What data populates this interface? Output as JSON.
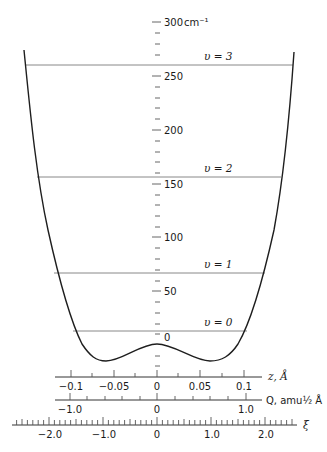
{
  "figure": {
    "energy_axis": {
      "unit_label": "cm⁻¹",
      "ticks": [
        {
          "value": 300,
          "label": "300",
          "y": 22
        },
        {
          "value": 250,
          "label": "250",
          "y": 76
        },
        {
          "value": 200,
          "label": "200",
          "y": 130
        },
        {
          "value": 150,
          "label": "150",
          "y": 184
        },
        {
          "value": 100,
          "label": "100",
          "y": 237
        },
        {
          "value": 50,
          "label": "50",
          "y": 291
        },
        {
          "value": 0,
          "label": "0",
          "y": 345
        }
      ],
      "minor_step": 10,
      "range": [
        -20,
        300
      ]
    },
    "levels": [
      {
        "label": "υ = 3",
        "energy": 260,
        "y": 65,
        "x1": 26,
        "x2": 293
      },
      {
        "label": "υ = 2",
        "energy": 156,
        "y": 177,
        "x1": 37,
        "x2": 281
      },
      {
        "label": "υ = 1",
        "energy": 67,
        "y": 273,
        "x1": 54,
        "x2": 265
      },
      {
        "label": "υ = 0",
        "energy": 13,
        "y": 331,
        "x1": 73,
        "x2": 247
      }
    ],
    "potential": {
      "barrier_energy": 0,
      "minimum_energy": -14,
      "minima_z": [
        -0.063,
        0.063
      ]
    },
    "x_axes": [
      {
        "name": "z",
        "label": "z, Å",
        "ticks": [
          {
            "value": -0.1,
            "label": "−0.1",
            "x": 71
          },
          {
            "value": -0.05,
            "label": "−0.05",
            "x": 114
          },
          {
            "value": 0,
            "label": "0",
            "x": 157
          },
          {
            "value": 0.05,
            "label": "0.05",
            "x": 200
          },
          {
            "value": 0.1,
            "label": "0.1",
            "x": 244
          }
        ]
      },
      {
        "name": "Q",
        "label": "Q, amu½ Å",
        "ticks": [
          {
            "value": -1.0,
            "label": "−1.0",
            "x": 70
          },
          {
            "value": 0,
            "label": "0",
            "x": 157
          },
          {
            "value": 1.0,
            "label": "1.0",
            "x": 246
          }
        ]
      },
      {
        "name": "xi",
        "label": "ξ",
        "ticks": [
          {
            "value": -2.0,
            "label": "−2.0",
            "x": 50
          },
          {
            "value": -1.0,
            "label": "−1.0",
            "x": 104
          },
          {
            "value": 0,
            "label": "0",
            "x": 157
          },
          {
            "value": 1.0,
            "label": "1.0",
            "x": 212
          },
          {
            "value": 2.0,
            "label": "2.0",
            "x": 266
          }
        ]
      }
    ]
  }
}
